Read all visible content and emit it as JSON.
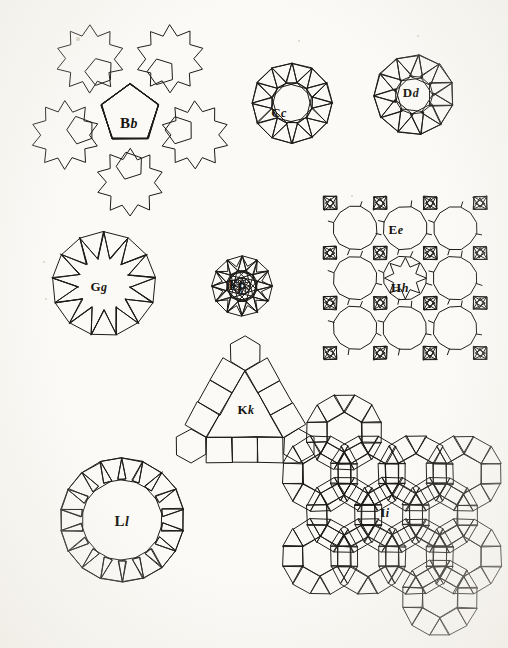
{
  "plate": {
    "width": 508,
    "height": 648,
    "background_color": "#fbfaf7",
    "ink_color": "#1d1b19",
    "description": "Engraved plate of nine labelled polygonal tessellation figures"
  },
  "figures": [
    {
      "id": "bb",
      "label_cap": "B",
      "label_low": "b",
      "label_x": 129,
      "label_y": 123,
      "center_x": 130,
      "center_y": 112,
      "kind": "pentagon-rosette",
      "caption": "Central pentagon ringed by pentagons forming ten-pointed star rosettes"
    },
    {
      "id": "cc",
      "label_cap": "C",
      "label_low": "c",
      "label_x": 279,
      "label_y": 113,
      "center_x": 292,
      "center_y": 103,
      "kind": "dodecagon-square-ring",
      "caption": "Dodecagon surrounded by a ring of tilted squares and triangles"
    },
    {
      "id": "dd",
      "label_cap": "D",
      "label_low": "d",
      "label_x": 411,
      "label_y": 93,
      "center_x": 413,
      "center_y": 95,
      "kind": "decagon-alternating-ring",
      "caption": "Decagon with an outer band of alternating squares and triangles"
    },
    {
      "id": "gg",
      "label_cap": "G",
      "label_low": "g",
      "label_x": 99,
      "label_y": 287,
      "center_x": 104,
      "center_y": 283,
      "kind": "star-triangle-wheel",
      "caption": "Star polygon of radiating triangles inside a polygonal ring"
    },
    {
      "id": "ff",
      "label_cap": "F",
      "label_low": "f",
      "label_x": 236,
      "label_y": 285,
      "center_x": 240,
      "center_y": 285,
      "kind": "square-star-rosette",
      "caption": "Twelve-pointed rosette built from squares and triangles"
    },
    {
      "id": "ee",
      "label_cap": "E",
      "label_low": "e",
      "label_x": 396,
      "label_y": 230,
      "center_x": 404,
      "center_y": 280,
      "kind": "octagon-square-grid",
      "caption": "Grid of large octagons with squares and triangles at the junctions"
    },
    {
      "id": "hh",
      "label_cap": "H",
      "label_low": "h",
      "label_x": 400,
      "label_y": 288,
      "center_x": 404,
      "center_y": 280,
      "kind": "star-void",
      "caption": "Star-shaped cell formed by inward pointing triangles within the Ee grid"
    },
    {
      "id": "kk",
      "label_cap": "K",
      "label_low": "k",
      "label_x": 246,
      "label_y": 410,
      "center_x": 243,
      "center_y": 405,
      "kind": "triangle-corner-hexagons",
      "caption": "Triangular panel edged with squares and hexagons at the corners"
    },
    {
      "id": "ll",
      "label_cap": "L",
      "label_low": "l",
      "label_x": 122,
      "label_y": 521,
      "center_x": 122,
      "center_y": 521,
      "kind": "large-polygon-square-ring",
      "caption": "Large regular polygon ringed by squares with pentagons between them"
    },
    {
      "id": "ii",
      "label_cap": "I",
      "label_low": "i",
      "label_x": 385,
      "label_y": 513,
      "center_x": 390,
      "center_y": 516,
      "kind": "rhombitrihexagonal",
      "caption": "Rhombitrihexagonal tiling of hexagons, squares and triangles"
    }
  ],
  "specks": [
    {
      "x": 78,
      "y": 39,
      "r": 1.6
    },
    {
      "x": 299,
      "y": 41,
      "r": 1.4
    },
    {
      "x": 418,
      "y": 36,
      "r": 1.2
    },
    {
      "x": 44,
      "y": 262,
      "r": 1.3
    },
    {
      "x": 46,
      "y": 299,
      "r": 1.2
    },
    {
      "x": 352,
      "y": 196,
      "r": 1.1
    }
  ]
}
